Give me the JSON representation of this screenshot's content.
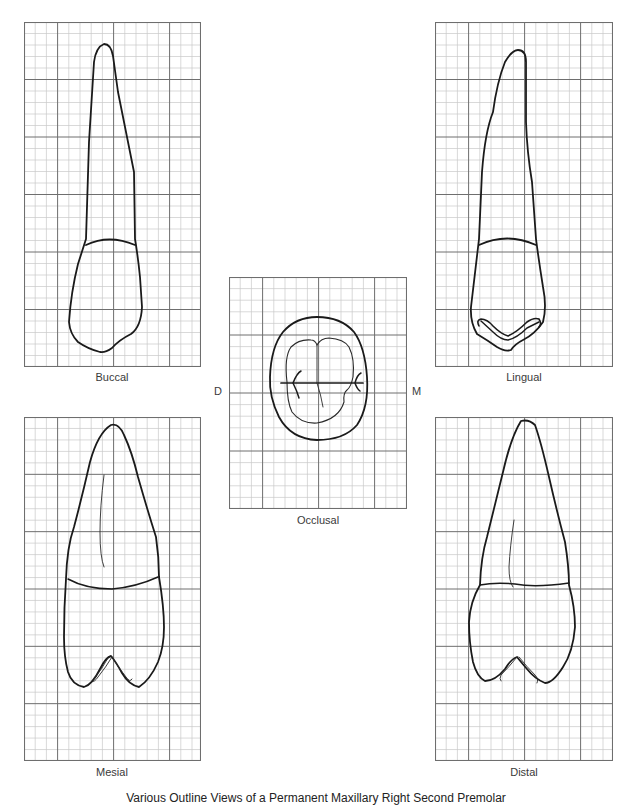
{
  "figure": {
    "caption": "Various Outline Views of a Permanent Maxillary Right Second Premolar",
    "grid": {
      "minor_color": "#c8c8c8",
      "major_color": "#6e6e6e",
      "border_color": "#6e6e6e"
    }
  },
  "views": {
    "buccal": {
      "label": "Buccal"
    },
    "lingual": {
      "label": "Lingual"
    },
    "occlusal": {
      "label": "Occlusal",
      "left_marker": "D",
      "right_marker": "M"
    },
    "mesial": {
      "label": "Mesial"
    },
    "distal": {
      "label": "Distal"
    }
  }
}
